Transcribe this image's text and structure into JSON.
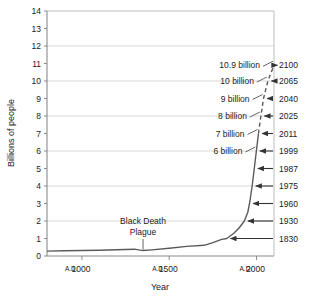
{
  "chart_data": {
    "type": "line",
    "title": "",
    "xlabel": "Year",
    "ylabel": "Billions of people",
    "ylim": [
      0,
      14
    ],
    "xlim": [
      800,
      2100
    ],
    "grid": true,
    "legend_position": "none",
    "y_ticks": [
      "0",
      "1",
      "2",
      "3",
      "4",
      "5",
      "6",
      "7",
      "8",
      "9",
      "10",
      "11",
      "12",
      "13",
      "14"
    ],
    "x_ticks": [
      {
        "prefix": "A.D.",
        "value": "1000"
      },
      {
        "prefix": "A.D.",
        "value": "1500"
      },
      {
        "prefix": "A.D.",
        "value": "2000"
      }
    ],
    "gridline_values": [
      2,
      4,
      6,
      8,
      10,
      12
    ],
    "series": [
      {
        "name": "World population",
        "style_solid_until_year": 2011,
        "points": [
          {
            "x": 800,
            "y": 0.28
          },
          {
            "x": 900,
            "y": 0.3
          },
          {
            "x": 1000,
            "y": 0.31
          },
          {
            "x": 1100,
            "y": 0.33
          },
          {
            "x": 1200,
            "y": 0.36
          },
          {
            "x": 1300,
            "y": 0.39
          },
          {
            "x": 1350,
            "y": 0.31
          },
          {
            "x": 1400,
            "y": 0.35
          },
          {
            "x": 1500,
            "y": 0.44
          },
          {
            "x": 1600,
            "y": 0.55
          },
          {
            "x": 1700,
            "y": 0.61
          },
          {
            "x": 1750,
            "y": 0.76
          },
          {
            "x": 1800,
            "y": 0.95
          },
          {
            "x": 1830,
            "y": 1.0
          },
          {
            "x": 1870,
            "y": 1.3
          },
          {
            "x": 1900,
            "y": 1.6
          },
          {
            "x": 1930,
            "y": 2.0
          },
          {
            "x": 1950,
            "y": 2.5
          },
          {
            "x": 1960,
            "y": 3.0
          },
          {
            "x": 1975,
            "y": 4.0
          },
          {
            "x": 1987,
            "y": 5.0
          },
          {
            "x": 1999,
            "y": 6.0
          },
          {
            "x": 2011,
            "y": 7.0
          },
          {
            "x": 2025,
            "y": 8.0
          },
          {
            "x": 2040,
            "y": 9.0
          },
          {
            "x": 2065,
            "y": 10.0
          },
          {
            "x": 2100,
            "y": 10.9
          }
        ]
      }
    ],
    "milestone_annotations": [
      {
        "label": "10.9 billion",
        "year": "2100",
        "population": 10.9
      },
      {
        "label": "10 billion",
        "year": "2065",
        "population": 10.0
      },
      {
        "label": "9 billion",
        "year": "2040",
        "population": 9.0
      },
      {
        "label": "8 billion",
        "year": "2025",
        "population": 8.0
      },
      {
        "label": "7 billion",
        "year": "2011",
        "population": 7.0
      },
      {
        "label": "6 billion",
        "year": "1999",
        "population": 6.0
      },
      {
        "label": "",
        "year": "1987",
        "population": 5.0
      },
      {
        "label": "",
        "year": "1975",
        "population": 4.0
      },
      {
        "label": "",
        "year": "1960",
        "population": 3.0
      },
      {
        "label": "",
        "year": "1930",
        "population": 2.0
      },
      {
        "label": "",
        "year": "1830",
        "population": 1.0
      }
    ],
    "annotations": [
      {
        "name": "black-death",
        "line1": "Black Death",
        "line2": "Plague",
        "year": 1350,
        "population": 0.31
      }
    ]
  }
}
